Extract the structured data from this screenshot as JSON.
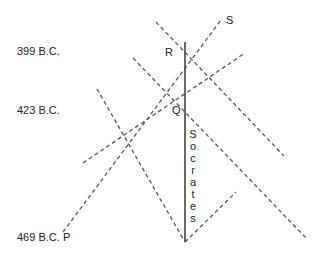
{
  "timeline": {
    "labels": [
      {
        "id": "399",
        "text": "399 B.C."
      },
      {
        "id": "423",
        "text": "423 B.C."
      },
      {
        "id": "469",
        "text": "469 B.C."
      }
    ]
  },
  "points": {
    "P": "P",
    "Q": "Q",
    "R": "R",
    "S": "S"
  },
  "worldline": {
    "name": "Socrates",
    "letters": [
      "S",
      "o",
      "c",
      "r",
      "a",
      "t",
      "e",
      "s"
    ]
  },
  "colors": {
    "dashed": "#555555",
    "solid": "#444444",
    "text": "#222222"
  }
}
